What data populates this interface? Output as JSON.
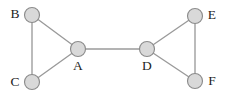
{
  "figure": {
    "width": 228,
    "height": 96,
    "background_color": "#ffffff"
  },
  "style": {
    "node_fill": "#d9d9d9",
    "node_stroke": "#8c8c8c",
    "node_radius": 7.5,
    "node_stroke_width": 1.15,
    "edge_color": "#9a9a9a",
    "edge_width": 1.35,
    "label_color": "#1d1d1d",
    "label_font_size": 13.5
  },
  "chart_data": {
    "type": "diagram",
    "diagram_kind": "node-link-graph",
    "directed": false,
    "title": "",
    "nodes": [
      {
        "id": "B",
        "label": "B",
        "x": 32,
        "y": 15,
        "label_x": 15,
        "label_y": 14,
        "label_position": "left"
      },
      {
        "id": "C",
        "label": "C",
        "x": 32,
        "y": 82,
        "label_x": 15,
        "label_y": 82,
        "label_position": "left"
      },
      {
        "id": "A",
        "label": "A",
        "x": 78,
        "y": 49,
        "label_x": 78,
        "label_y": 66,
        "label_position": "below"
      },
      {
        "id": "D",
        "label": "D",
        "x": 147,
        "y": 49,
        "label_x": 147,
        "label_y": 66,
        "label_position": "below"
      },
      {
        "id": "E",
        "label": "E",
        "x": 195,
        "y": 16,
        "label_x": 212,
        "label_y": 15,
        "label_position": "right"
      },
      {
        "id": "F",
        "label": "F",
        "x": 195,
        "y": 81,
        "label_x": 212,
        "label_y": 81,
        "label_position": "right"
      }
    ],
    "edges": [
      {
        "source": "B",
        "target": "C"
      },
      {
        "source": "B",
        "target": "A"
      },
      {
        "source": "C",
        "target": "A"
      },
      {
        "source": "A",
        "target": "D"
      },
      {
        "source": "D",
        "target": "E"
      },
      {
        "source": "D",
        "target": "F"
      },
      {
        "source": "E",
        "target": "F"
      }
    ],
    "node_count": 6,
    "edge_count": 7,
    "legend": [],
    "annotations": []
  }
}
